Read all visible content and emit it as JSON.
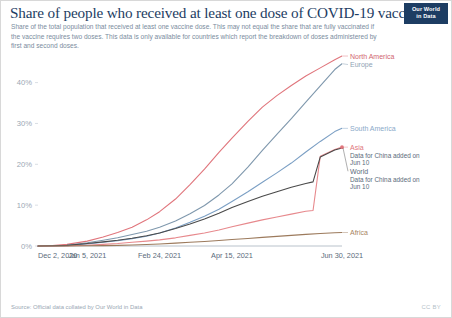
{
  "header": {
    "title": "Share of people who received at least one dose of COVID-19 vaccine",
    "subtitle": "Share of the total population that received at least one vaccine dose. This may not equal the share that are fully vaccinated if the vaccine requires two doses. This data is only available for countries which report the breakdown of doses administered by first and second doses.",
    "logo_line1": "Our World",
    "logo_line2": "in Data"
  },
  "footer": {
    "source": "Source: Official data collated by Our World in Data",
    "license": "CC BY"
  },
  "chart_data": {
    "type": "line",
    "title": "Share of people who received at least one dose of COVID-19 vaccine",
    "xlabel": "",
    "ylabel": "",
    "grid": false,
    "legend_position": "right",
    "ylim": [
      0,
      47
    ],
    "ytick_labels": [
      "0%",
      "10%",
      "20%",
      "30%",
      "40%"
    ],
    "ytick_values": [
      0,
      10,
      20,
      30,
      40
    ],
    "xtick_labels": [
      "Dec 2, 2020",
      "Jan 5, 2021",
      "Feb 24, 2021",
      "Apr 15, 2021",
      "Jun 30, 2021"
    ],
    "xtick_values": [
      0,
      34,
      84,
      134,
      210
    ],
    "xlim": [
      0,
      210
    ],
    "annotations": [
      {
        "text": "Data for China added on",
        "text2": "Jun 10",
        "series": "Asia"
      },
      {
        "text": "Data for China added on",
        "text2": "Jun 10",
        "series": "World"
      }
    ],
    "series": [
      {
        "name": "North America",
        "color": "#e0757c",
        "label_color": "#d1666f",
        "final_value": 46.5,
        "x": [
          0,
          10,
          20,
          34,
          45,
          55,
          65,
          75,
          84,
          95,
          105,
          115,
          125,
          134,
          145,
          155,
          165,
          175,
          185,
          195,
          205,
          210
        ],
        "y": [
          0.0,
          0.1,
          0.4,
          1.2,
          2.2,
          3.3,
          4.6,
          6.4,
          8.4,
          11.5,
          15.0,
          18.8,
          22.9,
          26.4,
          30.5,
          34.0,
          36.8,
          39.3,
          41.6,
          43.6,
          45.6,
          46.5
        ]
      },
      {
        "name": "Europe",
        "color": "#7f98ad",
        "label_color": "#8fa3b4",
        "final_value": 44.6,
        "x": [
          0,
          10,
          20,
          34,
          45,
          55,
          65,
          75,
          84,
          95,
          105,
          115,
          125,
          134,
          145,
          155,
          165,
          175,
          185,
          195,
          205,
          210
        ],
        "y": [
          0.0,
          0.05,
          0.2,
          0.8,
          1.4,
          2.0,
          2.8,
          3.6,
          4.6,
          6.1,
          7.9,
          9.9,
          12.5,
          15.2,
          19.3,
          23.4,
          27.3,
          31.2,
          35.2,
          39.2,
          43.2,
          44.6
        ]
      },
      {
        "name": "South America",
        "color": "#7b9fc4",
        "label_color": "#8aa9c9",
        "final_value": 28.8,
        "x": [
          0,
          10,
          20,
          34,
          45,
          55,
          65,
          75,
          84,
          95,
          105,
          115,
          125,
          134,
          145,
          155,
          165,
          175,
          185,
          195,
          205,
          210
        ],
        "y": [
          0.0,
          0.0,
          0.1,
          0.5,
          0.9,
          1.3,
          1.8,
          2.4,
          3.2,
          4.4,
          5.8,
          7.3,
          9.0,
          10.9,
          13.3,
          15.6,
          17.9,
          20.3,
          23.0,
          25.6,
          28.0,
          28.8
        ]
      },
      {
        "name": "Asia",
        "color": "#e7898d",
        "label_color": "#e0757c",
        "final_value": 24.2,
        "jump_x": 190,
        "jump_from": 8.7,
        "jump_to": 21.8,
        "x": [
          0,
          10,
          20,
          34,
          45,
          55,
          65,
          75,
          84,
          95,
          105,
          115,
          125,
          134,
          145,
          155,
          165,
          175,
          185,
          190,
          195,
          205,
          210
        ],
        "y": [
          0.0,
          0.0,
          0.05,
          0.2,
          0.4,
          0.6,
          0.9,
          1.2,
          1.5,
          2.0,
          2.6,
          3.2,
          3.9,
          4.7,
          5.6,
          6.4,
          7.1,
          7.8,
          8.5,
          8.7,
          22.0,
          23.6,
          24.2
        ]
      },
      {
        "name": "World",
        "color": "#4a4a4a",
        "label_color": "#5b6b7b",
        "final_value": 24.0,
        "jump_x": 190,
        "jump_from": 15.7,
        "jump_to": 21.6,
        "x": [
          0,
          10,
          20,
          34,
          45,
          55,
          65,
          75,
          84,
          95,
          105,
          115,
          125,
          134,
          145,
          155,
          165,
          175,
          185,
          190,
          195,
          205,
          210
        ],
        "y": [
          0.0,
          0.05,
          0.15,
          0.6,
          1.0,
          1.4,
          1.9,
          2.5,
          3.2,
          4.3,
          5.4,
          6.6,
          8.0,
          9.4,
          10.9,
          12.2,
          13.3,
          14.4,
          15.3,
          15.7,
          21.8,
          23.5,
          24.0
        ]
      },
      {
        "name": "Africa",
        "color": "#9c7a5c",
        "label_color": "#a8855f",
        "final_value": 3.3,
        "x": [
          0,
          10,
          20,
          34,
          45,
          55,
          65,
          75,
          84,
          95,
          105,
          115,
          125,
          134,
          145,
          155,
          165,
          175,
          185,
          195,
          205,
          210
        ],
        "y": [
          0.0,
          0.0,
          0.0,
          0.05,
          0.1,
          0.15,
          0.25,
          0.35,
          0.5,
          0.7,
          0.9,
          1.1,
          1.35,
          1.6,
          1.85,
          2.1,
          2.35,
          2.6,
          2.85,
          3.05,
          3.25,
          3.3
        ]
      }
    ],
    "legend": [
      {
        "name": "North America",
        "y_pos": 46.5
      },
      {
        "name": "Europe",
        "y_pos": 44.6
      },
      {
        "name": "South America",
        "y_pos": 28.8
      },
      {
        "name": "Asia",
        "y_pos": 24.2
      },
      {
        "name": "World",
        "y_pos": 24.0
      },
      {
        "name": "Africa",
        "y_pos": 3.3
      }
    ]
  }
}
